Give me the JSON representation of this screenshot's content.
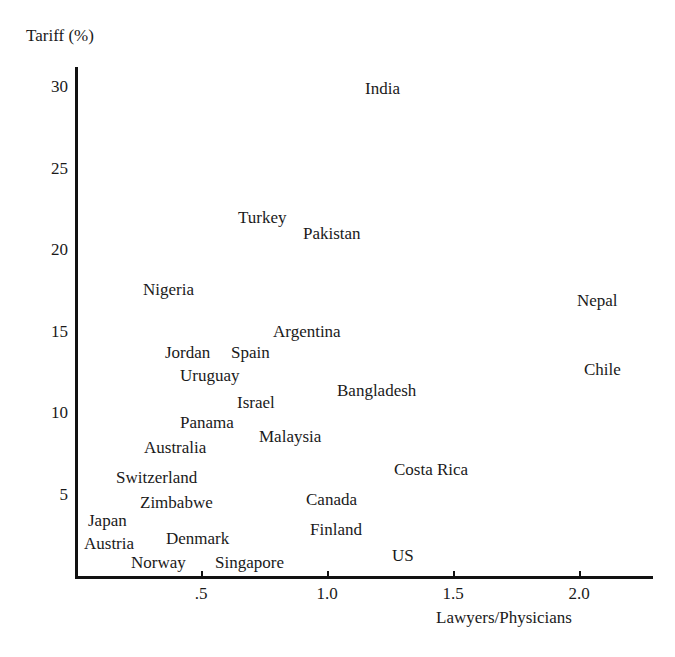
{
  "chart_data": {
    "type": "scatter",
    "title": "",
    "xlabel": "Lawyers/Physicians",
    "ylabel": "Tariff (%)",
    "xlim": [
      0,
      2.3
    ],
    "ylim": [
      0,
      31.5
    ],
    "grid": false,
    "legend": "none",
    "marker_style": "text-label",
    "xticks": [
      {
        "value": 0.5,
        "label": ".5"
      },
      {
        "value": 1.0,
        "label": "1.0"
      },
      {
        "value": 1.5,
        "label": "1.5"
      },
      {
        "value": 2.0,
        "label": "2.0"
      }
    ],
    "yticks": [
      {
        "value": 5,
        "label": "5"
      },
      {
        "value": 10,
        "label": "10"
      },
      {
        "value": 15,
        "label": "15"
      },
      {
        "value": 20,
        "label": "20"
      },
      {
        "value": 25,
        "label": "25"
      },
      {
        "value": 30,
        "label": "30"
      }
    ],
    "points": [
      {
        "label": "India",
        "x": 1.24,
        "y": 30.3,
        "px": 365,
        "py": 80
      },
      {
        "label": "Turkey",
        "x": 0.74,
        "y": 23.6,
        "px": 238,
        "py": 209
      },
      {
        "label": "Pakistan",
        "x": 0.96,
        "y": 21.2,
        "px": 303,
        "py": 225
      },
      {
        "label": "Nigeria",
        "x": 0.58,
        "y": 17.4,
        "px": 143,
        "py": 281
      },
      {
        "label": "Nepal",
        "x": 2.06,
        "y": 17.2,
        "px": 577,
        "py": 292
      },
      {
        "label": "Argentina",
        "x": 0.91,
        "y": 15.1,
        "px": 273,
        "py": 323
      },
      {
        "label": "Jordan",
        "x": 0.62,
        "y": 14.0,
        "px": 165,
        "py": 344
      },
      {
        "label": "Spain",
        "x": 0.75,
        "y": 14.0,
        "px": 231,
        "py": 344
      },
      {
        "label": "Chile",
        "x": 2.11,
        "y": 13.1,
        "px": 584,
        "py": 361
      },
      {
        "label": "Uruguay",
        "x": 0.67,
        "y": 12.6,
        "px": 180,
        "py": 367
      },
      {
        "label": "Israel",
        "x": 0.81,
        "y": 11.1,
        "px": 237,
        "py": 394
      },
      {
        "label": "Bangladesh",
        "x": 1.17,
        "y": 11.4,
        "px": 337,
        "py": 382
      },
      {
        "label": "Panama",
        "x": 0.68,
        "y": 9.6,
        "px": 180,
        "py": 414
      },
      {
        "label": "Malaysia",
        "x": 0.88,
        "y": 9.1,
        "px": 259,
        "py": 428
      },
      {
        "label": "Australia",
        "x": 0.62,
        "y": 8.1,
        "px": 144,
        "py": 439
      },
      {
        "label": "Costa Rica",
        "x": 1.37,
        "y": 6.6,
        "px": 394,
        "py": 461
      },
      {
        "label": "Switzerland",
        "x": 0.52,
        "y": 5.9,
        "px": 116,
        "py": 469
      },
      {
        "label": "Zimbabwe",
        "x": 0.61,
        "y": 4.8,
        "px": 140,
        "py": 494
      },
      {
        "label": "Canada",
        "x": 1.08,
        "y": 4.7,
        "px": 306,
        "py": 491
      },
      {
        "label": "Japan",
        "x": 0.4,
        "y": 3.8,
        "px": 88,
        "py": 512
      },
      {
        "label": "Finland",
        "x": 1.09,
        "y": 3.5,
        "px": 310,
        "py": 521
      },
      {
        "label": "Denmark",
        "x": 0.65,
        "y": 3.0,
        "px": 166,
        "py": 530
      },
      {
        "label": "Austria",
        "x": 0.38,
        "y": 2.8,
        "px": 84,
        "py": 535
      },
      {
        "label": "Norway",
        "x": 0.57,
        "y": 1.5,
        "px": 131,
        "py": 554
      },
      {
        "label": "Singapore",
        "x": 0.79,
        "y": 1.5,
        "px": 215,
        "py": 554
      },
      {
        "label": "US",
        "x": 1.3,
        "y": 1.2,
        "px": 392,
        "py": 547
      }
    ]
  },
  "axes": {
    "y_title": "Tariff (%)",
    "x_title": "Lawyers/Physicians"
  }
}
